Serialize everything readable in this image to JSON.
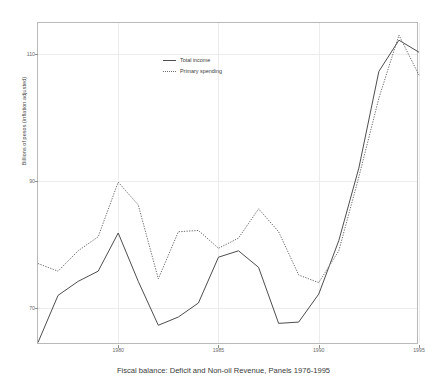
{
  "chart_data": {
    "type": "line",
    "title": "",
    "caption": "Fiscal balance: Deficit and Non-oil Revenue, Panels 1976-1995",
    "xlabel": "",
    "ylabel": "Billions of pesos (inflation adjusted)",
    "xlim": [
      1976,
      1995
    ],
    "ylim": [
      64.2,
      114.8
    ],
    "grid": true,
    "legend_position": "top-center",
    "x_ticks": [
      "1980",
      "1985",
      "1990",
      "1995"
    ],
    "x_tick_values": [
      1980,
      1985,
      1990,
      1995
    ],
    "y_ticks": [
      "70",
      "90",
      "110"
    ],
    "y_tick_values": [
      70,
      90,
      110
    ],
    "x": [
      1976,
      1977,
      1978,
      1979,
      1980,
      1981,
      1982,
      1983,
      1984,
      1985,
      1986,
      1987,
      1988,
      1989,
      1990,
      1991,
      1992,
      1993,
      1994,
      1995
    ],
    "series": [
      {
        "name": "Total income",
        "style": "solid",
        "color": "#4d4d4d",
        "values": [
          64.6,
          72.0,
          74.2,
          75.8,
          81.8,
          74.2,
          67.3,
          68.6,
          70.8,
          78.0,
          79.0,
          76.4,
          67.6,
          67.8,
          72.2,
          80.6,
          92.0,
          107.2,
          112.1,
          110.2
        ]
      },
      {
        "name": "Primary spending",
        "style": "dotted",
        "color": "#6e6e6e",
        "values": [
          77.0,
          75.8,
          79.0,
          81.2,
          89.8,
          86.2,
          74.6,
          82.0,
          82.2,
          79.4,
          81.0,
          85.6,
          82.0,
          75.2,
          74.0,
          79.0,
          90.6,
          103.0,
          112.9,
          106.6
        ]
      }
    ]
  },
  "legend": {
    "items": [
      {
        "label": "Total income",
        "style": "solid"
      },
      {
        "label": "Primary spending",
        "style": "dotted"
      }
    ]
  },
  "axes": {
    "y_title": "Billions of pesos (inflation adjusted)"
  }
}
